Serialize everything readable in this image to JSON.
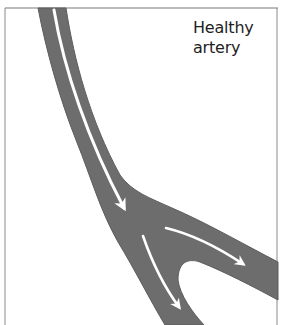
{
  "figure": {
    "label_lines": [
      "Healthy",
      "artery"
    ],
    "colors": {
      "vessel": "#6e6e6e",
      "vessel_edge": "#5a5a5a",
      "flow_arrow": "#ffffff",
      "frame": "#7a7a7a",
      "background": "#ffffff",
      "text": "#1e1e1e"
    },
    "elements": {
      "vessel": "artery with bifurcation",
      "arrows": [
        {
          "name": "main-trunk-flow-arrow",
          "direction": "down-right"
        },
        {
          "name": "right-branch-flow-arrow",
          "direction": "right-down"
        },
        {
          "name": "lower-branch-flow-arrow",
          "direction": "down-right"
        }
      ]
    }
  }
}
